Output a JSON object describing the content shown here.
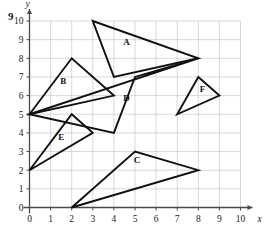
{
  "question_number": "9",
  "axes": {
    "x_label": "x",
    "y_label": "y",
    "x_min": 0,
    "x_max": 10,
    "y_min": 0,
    "y_max": 10,
    "x_ticks": [
      "0",
      "1",
      "2",
      "3",
      "4",
      "5",
      "6",
      "7",
      "8",
      "9",
      "10"
    ],
    "y_ticks": [
      "0",
      "1",
      "2",
      "3",
      "4",
      "5",
      "6",
      "7",
      "8",
      "9",
      "10"
    ],
    "grid": true
  },
  "chart_data": {
    "type": "scatter",
    "title": "",
    "xlabel": "x",
    "ylabel": "y",
    "xlim": [
      0,
      10
    ],
    "ylim": [
      0,
      10
    ],
    "grid": true,
    "shapes": [
      {
        "label": "A",
        "vertices": [
          [
            3,
            10
          ],
          [
            8,
            8
          ],
          [
            4,
            7
          ]
        ],
        "label_at": [
          4.6,
          8.7
        ]
      },
      {
        "label": "B",
        "vertices": [
          [
            0,
            5
          ],
          [
            2,
            8
          ],
          [
            4,
            6
          ]
        ],
        "label_at": [
          1.6,
          6.6
        ]
      },
      {
        "label": "C",
        "vertices": [
          [
            2,
            0
          ],
          [
            5,
            3
          ],
          [
            8,
            2
          ]
        ],
        "label_at": [
          5.1,
          2.4
        ]
      },
      {
        "label": "D",
        "vertices": [
          [
            0,
            5
          ],
          [
            8,
            8
          ],
          [
            5,
            7
          ],
          [
            4,
            4
          ]
        ],
        "label_at": [
          4.6,
          5.7
        ]
      },
      {
        "label": "E",
        "vertices": [
          [
            0,
            2
          ],
          [
            2,
            5
          ],
          [
            3,
            4
          ]
        ],
        "label_at": [
          1.5,
          3.6
        ]
      },
      {
        "label": "F",
        "vertices": [
          [
            8,
            7
          ],
          [
            9,
            6
          ],
          [
            7,
            5
          ]
        ],
        "label_at": [
          8.2,
          6.2
        ]
      }
    ]
  },
  "colors": {
    "grid": "#c9c6cf",
    "axis": "#4a4a4a",
    "shape_stroke": "#111111",
    "background": "#ffffff"
  }
}
